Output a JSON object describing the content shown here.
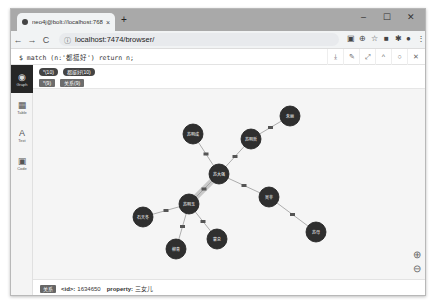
{
  "browser": {
    "tab_title": "neo4j@bolt://localhost:7687",
    "tab_close": "×",
    "new_tab": "+",
    "url": "localhost:7474/browser/",
    "window_controls": [
      "–",
      "☐",
      "✕"
    ],
    "nav": {
      "back": "←",
      "forward": "→",
      "reload": "C"
    },
    "extensions": [
      "▣",
      "⊕",
      "☆",
      "■",
      "✱",
      "●",
      "⋮"
    ]
  },
  "editor": {
    "query": "$ match (n:'都挺好') return n;",
    "buttons": [
      "⤓",
      "✎",
      "⤢",
      "^",
      "○",
      "✕"
    ]
  },
  "sidebar": {
    "items": [
      {
        "label": "Graph",
        "icon": "◉",
        "active": true
      },
      {
        "label": "Table",
        "icon": "▦",
        "active": false
      },
      {
        "label": "Text",
        "icon": "A",
        "active": false
      },
      {
        "label": "Code",
        "icon": "▣",
        "active": false
      }
    ]
  },
  "legend": {
    "node_labels": [
      "*(10)",
      "都挺好(10)"
    ],
    "rel_types": [
      "*(9)",
      "关系(9)"
    ]
  },
  "graph": {
    "node_color": "#2f2f2f",
    "edge_color": "#9a9a9a",
    "nodes": [
      {
        "id": "n1",
        "label": "苏明成",
        "x": 160,
        "y": 45
      },
      {
        "id": "n2",
        "label": "苏明哲",
        "x": 218,
        "y": 50
      },
      {
        "id": "n3",
        "label": "朱丽",
        "x": 257,
        "y": 27
      },
      {
        "id": "n4",
        "label": "苏大强",
        "x": 186,
        "y": 85
      },
      {
        "id": "n5",
        "label": "苏明玉",
        "x": 156,
        "y": 115
      },
      {
        "id": "n6",
        "label": "石天冬",
        "x": 110,
        "y": 128
      },
      {
        "id": "n7",
        "label": "柳青",
        "x": 143,
        "y": 160
      },
      {
        "id": "n8",
        "label": "蒙总",
        "x": 184,
        "y": 150
      },
      {
        "id": "n9",
        "label": "吴非",
        "x": 236,
        "y": 108
      },
      {
        "id": "n10",
        "label": "苏母",
        "x": 283,
        "y": 143
      }
    ],
    "edges": [
      {
        "from": "n1",
        "to": "n4",
        "label": "关系"
      },
      {
        "from": "n2",
        "to": "n4",
        "label": "关系"
      },
      {
        "from": "n3",
        "to": "n2",
        "label": "关系"
      },
      {
        "from": "n4",
        "to": "n5",
        "label": "关系",
        "selected": true
      },
      {
        "from": "n6",
        "to": "n5",
        "label": "关系"
      },
      {
        "from": "n5",
        "to": "n7",
        "label": "关系"
      },
      {
        "from": "n5",
        "to": "n8",
        "label": "关系"
      },
      {
        "from": "n4",
        "to": "n9",
        "label": "关系"
      },
      {
        "from": "n9",
        "to": "n10",
        "label": "关系"
      }
    ]
  },
  "zoom": {
    "in": "⊕",
    "out": "⊖"
  },
  "status": {
    "type_badge": "关系",
    "id_key": "<id>:",
    "id_value": "1634650",
    "prop_key": "property:",
    "prop_value": "三女儿"
  }
}
